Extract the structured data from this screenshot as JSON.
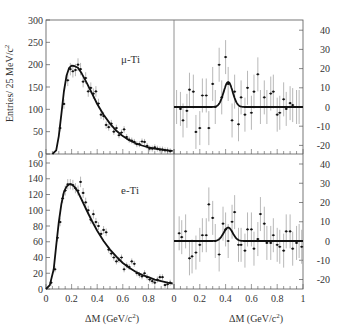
{
  "chart_data": [
    {
      "type": "scatter",
      "panel": "top-left",
      "label": "μ-Ti",
      "ylabel": "Entries/ 25 MeV/c²",
      "xlim": [
        0,
        1
      ],
      "ylim": [
        0,
        300
      ],
      "yticks": [
        0,
        50,
        100,
        150,
        200,
        250,
        300
      ],
      "series": [
        {
          "name": "data",
          "x": [
            0.11,
            0.14,
            0.17,
            0.19,
            0.21,
            0.23,
            0.25,
            0.27,
            0.29,
            0.31,
            0.33,
            0.35,
            0.37,
            0.39,
            0.41,
            0.43,
            0.45,
            0.47,
            0.49,
            0.51,
            0.53,
            0.55,
            0.57,
            0.59,
            0.61,
            0.63,
            0.65,
            0.67,
            0.69,
            0.71,
            0.73,
            0.75,
            0.77,
            0.79,
            0.81,
            0.83,
            0.85,
            0.87,
            0.89,
            0.91,
            0.93,
            0.95,
            0.97
          ],
          "y": [
            58,
            112,
            165,
            190,
            185,
            188,
            200,
            190,
            162,
            170,
            140,
            148,
            135,
            140,
            113,
            88,
            85,
            65,
            60,
            68,
            50,
            58,
            42,
            48,
            55,
            38,
            32,
            30,
            27,
            22,
            22,
            28,
            27,
            18,
            12,
            12,
            15,
            12,
            10,
            10,
            8,
            8,
            6
          ]
        },
        {
          "name": "fit",
          "x": [
            0.05,
            0.08,
            0.1,
            0.12,
            0.14,
            0.16,
            0.18,
            0.2,
            0.22,
            0.25,
            0.28,
            0.32,
            0.36,
            0.4,
            0.45,
            0.5,
            0.55,
            0.6,
            0.65,
            0.7,
            0.75,
            0.8,
            0.85,
            0.9,
            0.95,
            0.99
          ],
          "y": [
            0,
            8,
            40,
            90,
            140,
            175,
            192,
            198,
            197,
            193,
            180,
            158,
            135,
            112,
            88,
            68,
            52,
            40,
            31,
            24,
            19,
            15,
            12,
            10,
            8,
            7
          ]
        }
      ]
    },
    {
      "type": "scatter",
      "panel": "bottom-left",
      "label": "e-Ti",
      "xlabel": "ΔM (GeV/c²)",
      "xlim": [
        0,
        1
      ],
      "ylim": [
        0,
        170
      ],
      "yticks": [
        0,
        20,
        40,
        60,
        80,
        100,
        120,
        140,
        160
      ],
      "xticks": [
        0,
        0.2,
        0.4,
        0.6,
        0.8
      ],
      "series": [
        {
          "name": "data",
          "x": [
            0.04,
            0.07,
            0.09,
            0.11,
            0.13,
            0.15,
            0.17,
            0.19,
            0.21,
            0.23,
            0.25,
            0.27,
            0.29,
            0.31,
            0.33,
            0.35,
            0.37,
            0.39,
            0.41,
            0.43,
            0.45,
            0.47,
            0.49,
            0.51,
            0.53,
            0.55,
            0.57,
            0.59,
            0.61,
            0.63,
            0.65,
            0.67,
            0.69,
            0.71,
            0.73,
            0.75,
            0.77,
            0.79,
            0.81,
            0.83,
            0.85,
            0.87,
            0.89,
            0.91,
            0.93,
            0.95,
            0.97
          ],
          "y": [
            8,
            25,
            65,
            85,
            115,
            125,
            133,
            133,
            132,
            128,
            125,
            136,
            122,
            110,
            100,
            88,
            95,
            85,
            80,
            70,
            75,
            72,
            50,
            45,
            40,
            35,
            37,
            40,
            25,
            30,
            28,
            35,
            32,
            20,
            18,
            16,
            20,
            15,
            12,
            10,
            8,
            12,
            15,
            15,
            5,
            6,
            8
          ]
        },
        {
          "name": "fit",
          "x": [
            0.0,
            0.03,
            0.06,
            0.08,
            0.1,
            0.12,
            0.14,
            0.16,
            0.18,
            0.2,
            0.22,
            0.25,
            0.28,
            0.32,
            0.36,
            0.4,
            0.45,
            0.5,
            0.55,
            0.6,
            0.65,
            0.7,
            0.75,
            0.8,
            0.85,
            0.9,
            0.95,
            0.99
          ],
          "y": [
            0,
            5,
            25,
            55,
            85,
            108,
            123,
            130,
            133,
            133,
            130,
            123,
            113,
            99,
            86,
            74,
            61,
            50,
            41,
            33,
            27,
            22,
            18,
            15,
            12,
            10,
            8,
            7
          ]
        }
      ]
    },
    {
      "type": "scatter",
      "panel": "top-right",
      "xlim": [
        0,
        1
      ],
      "ylim": [
        -24.5,
        45
      ],
      "yticks": [
        -20,
        -10,
        0,
        10,
        20,
        30,
        40
      ],
      "series": [
        {
          "name": "data",
          "x": [
            0.02,
            0.05,
            0.07,
            0.1,
            0.12,
            0.15,
            0.17,
            0.2,
            0.22,
            0.25,
            0.27,
            0.3,
            0.32,
            0.35,
            0.37,
            0.4,
            0.42,
            0.45,
            0.47,
            0.5,
            0.52,
            0.55,
            0.57,
            0.6,
            0.62,
            0.65,
            0.67,
            0.7,
            0.72,
            0.75,
            0.77,
            0.8,
            0.82,
            0.85,
            0.87,
            0.9,
            0.92,
            0.95,
            0.97
          ],
          "y": [
            0,
            -1,
            -7,
            -2,
            9,
            8,
            -13,
            -11,
            6,
            6,
            -11,
            12,
            0,
            22,
            5,
            26,
            12,
            -7,
            8,
            -9,
            5,
            -4,
            10,
            -3,
            8,
            17,
            0,
            5,
            0,
            7,
            8,
            -4,
            -3,
            4,
            -1,
            2,
            1,
            0,
            0
          ]
        },
        {
          "name": "fit",
          "type": "gaussian",
          "mean": 0.42,
          "sigma": 0.035,
          "amplitude": 13,
          "baseline": 0
        }
      ]
    },
    {
      "type": "scatter",
      "panel": "bottom-right",
      "xlabel": "ΔM (GeV/c²)",
      "xlim": [
        0,
        1
      ],
      "ylim": [
        -25,
        45
      ],
      "yticks": [
        -20,
        -10,
        0,
        10,
        20,
        30,
        40
      ],
      "xticks": [
        0,
        0.2,
        0.4,
        0.6,
        0.8,
        1
      ],
      "series": [
        {
          "name": "data",
          "x": [
            0.04,
            0.06,
            0.09,
            0.12,
            0.14,
            0.17,
            0.2,
            0.22,
            0.25,
            0.27,
            0.3,
            0.32,
            0.35,
            0.38,
            0.4,
            0.42,
            0.45,
            0.47,
            0.5,
            0.52,
            0.55,
            0.57,
            0.6,
            0.62,
            0.65,
            0.67,
            0.7,
            0.72,
            0.75,
            0.77,
            0.8,
            0.82,
            0.85,
            0.87,
            0.9,
            0.92,
            0.95,
            0.97,
            0.99
          ],
          "y": [
            4,
            2,
            5,
            -9,
            -8,
            -6,
            -2,
            3,
            3,
            19,
            12,
            0,
            -7,
            9,
            6,
            0,
            10,
            15,
            -2,
            -2,
            -5,
            6,
            6,
            -4,
            1,
            14,
            9,
            -1,
            -1,
            3,
            -2,
            -3,
            -5,
            5,
            5,
            -4,
            -1,
            0,
            -3
          ]
        },
        {
          "name": "fit",
          "type": "gaussian",
          "mean": 0.42,
          "sigma": 0.035,
          "amplitude": 7,
          "baseline": 0
        }
      ]
    }
  ],
  "labels": {
    "ylabel": "Entries/ 25 MeV/c",
    "ylabel_sup": "2",
    "top_label": "μ-Ti",
    "bottom_label": "e-Ti",
    "xlabel_left": "ΔM  (GeV/c",
    "xlabel_right": "ΔM  (GeV/c",
    "xlabel_sup": "2",
    "xlabel_close": ")"
  }
}
